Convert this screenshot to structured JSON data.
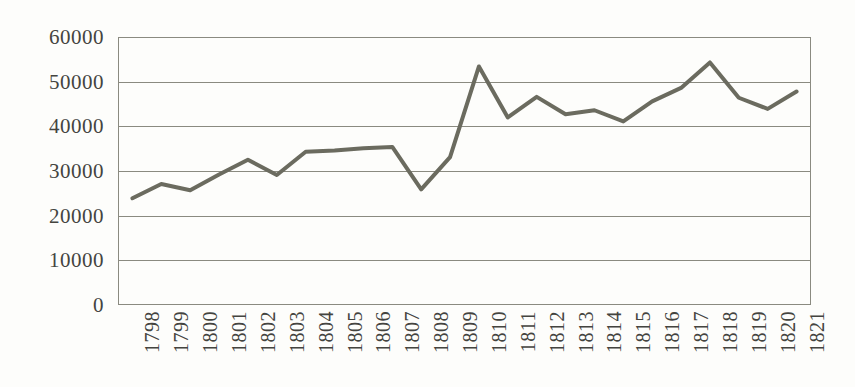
{
  "chart_data": {
    "type": "line",
    "title": "",
    "xlabel": "",
    "ylabel": "",
    "categories": [
      "1798",
      "1799",
      "1800",
      "1801",
      "1802",
      "1803",
      "1804",
      "1805",
      "1806",
      "1807",
      "1808",
      "1809",
      "1810",
      "1811",
      "1812",
      "1813",
      "1814",
      "1815",
      "1816",
      "1817",
      "1818",
      "1819",
      "1820",
      "1821"
    ],
    "values": [
      23900,
      27100,
      25700,
      29200,
      32500,
      29100,
      34300,
      34600,
      35100,
      35400,
      25900,
      33100,
      53400,
      42000,
      46600,
      42700,
      43600,
      41100,
      45600,
      48600,
      54300,
      46400,
      43900,
      47800
    ],
    "series": [
      {
        "name": "series-1",
        "values": [
          23900,
          27100,
          25700,
          29200,
          32500,
          29100,
          34300,
          34600,
          35100,
          35400,
          25900,
          33100,
          53400,
          42000,
          46600,
          42700,
          43600,
          41100,
          45600,
          48600,
          54300,
          46400,
          43900,
          47800
        ]
      }
    ],
    "y_ticks": [
      "0",
      "10000",
      "20000",
      "30000",
      "40000",
      "50000",
      "60000"
    ],
    "y_tick_values": [
      0,
      10000,
      20000,
      30000,
      40000,
      50000,
      60000
    ],
    "ylim": [
      0,
      60000
    ],
    "grid": true,
    "legend": "none",
    "line_color": "#6b6b5f",
    "grid_color": "#8a8a80",
    "background_color": "#fdfdfb"
  }
}
